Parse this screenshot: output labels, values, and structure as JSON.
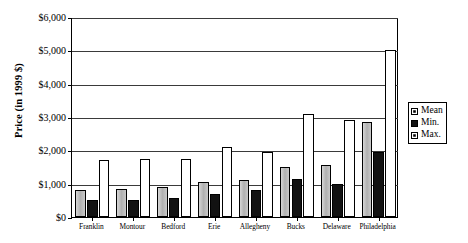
{
  "chart_data": {
    "type": "bar",
    "title": "",
    "xlabel": "",
    "ylabel": "Price (in 1999 $)",
    "ylim": [
      0,
      6000
    ],
    "yticks": [
      "$0",
      "$1,000",
      "$2,000",
      "$3,000",
      "$4,000",
      "$5,000",
      "$6,000"
    ],
    "ytick_values": [
      0,
      1000,
      2000,
      3000,
      4000,
      5000,
      6000
    ],
    "grid": true,
    "legend_position": "right",
    "categories": [
      "Franklin",
      "Montour",
      "Bedford",
      "Erie",
      "Allegheny",
      "Bucks",
      "Delaware",
      "Philadelphia"
    ],
    "series": [
      {
        "name": "Mean",
        "values": [
          800,
          850,
          900,
          1050,
          1100,
          1500,
          1550,
          2850
        ]
      },
      {
        "name": "Min.",
        "values": [
          500,
          500,
          560,
          700,
          800,
          1150,
          1000,
          1950
        ]
      },
      {
        "name": "Max.",
        "values": [
          1700,
          1750,
          1750,
          2100,
          1950,
          3100,
          2900,
          5000
        ]
      }
    ]
  },
  "legend": {
    "items": [
      {
        "label": "Mean",
        "swatch": "mean-swatch"
      },
      {
        "label": "Min.",
        "swatch": "min-swatch"
      },
      {
        "label": "Max.",
        "swatch": "max-swatch"
      }
    ]
  },
  "colors": {
    "mean": "#bdbdbd",
    "min": "#121212",
    "max": "#ffffff",
    "axis": "#000000",
    "gridline": "#3a3a3a"
  }
}
